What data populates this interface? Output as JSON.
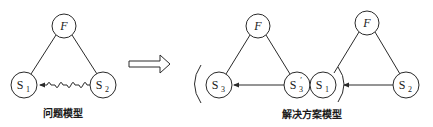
{
  "diagram": {
    "colors": {
      "stroke": "#2a2a2a",
      "background": "#ffffff"
    },
    "problem_model": {
      "caption": "问题模型",
      "nodes": {
        "F": {
          "label": "F"
        },
        "S1": {
          "main": "S",
          "sub": "1"
        },
        "S2": {
          "main": "S",
          "sub": "2"
        }
      },
      "edges": [
        {
          "from": "F",
          "to": "S1",
          "type": "line"
        },
        {
          "from": "F",
          "to": "S2",
          "type": "line"
        },
        {
          "from": "S2",
          "to": "S1",
          "type": "insufficient-wavy-arrow"
        }
      ]
    },
    "transition_arrow": {
      "type": "hollow-right-arrow"
    },
    "solution_model": {
      "caption": "解决方案模型",
      "left": {
        "nodes": {
          "F": {
            "label": "F"
          },
          "S3": {
            "main": "S",
            "sub": "3"
          },
          "S3p": {
            "main": "S",
            "sub": "3",
            "prime": "′"
          }
        },
        "edges": [
          {
            "from": "F",
            "to": "S3",
            "type": "line"
          },
          {
            "from": "F",
            "to": "S3p",
            "type": "line"
          },
          {
            "from": "S3p",
            "to": "S3",
            "type": "solid-arrow"
          }
        ],
        "bracket": "("
      },
      "right": {
        "nodes": {
          "F": {
            "label": "F"
          },
          "S1": {
            "main": "S",
            "sub": "1"
          },
          "S2": {
            "main": "S",
            "sub": "2"
          }
        },
        "edges": [
          {
            "from": "F",
            "to": "S1",
            "type": "line"
          },
          {
            "from": "F",
            "to": "S2",
            "type": "line"
          },
          {
            "from": "S2",
            "to": "S1",
            "type": "solid-arrow"
          }
        ],
        "bracket": ")"
      }
    }
  }
}
